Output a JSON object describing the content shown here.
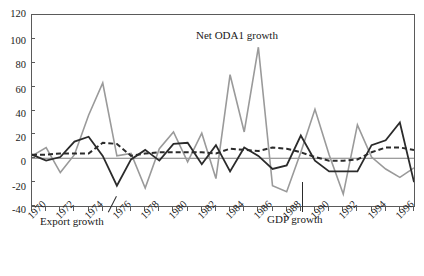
{
  "chart_data": {
    "type": "line",
    "title": "",
    "xlabel": "",
    "ylabel": "",
    "ylim": [
      -40,
      120
    ],
    "xlim": [
      1970,
      1997
    ],
    "yticks": [
      -40,
      -20,
      0,
      20,
      40,
      60,
      80,
      100,
      120
    ],
    "xticks": [
      1970,
      1972,
      1974,
      1976,
      1978,
      1980,
      1982,
      1984,
      1986,
      1988,
      1990,
      1992,
      1994,
      1996
    ],
    "xtick_labels": [
      "1970",
      "1972",
      "1974",
      "1976",
      "1978",
      "1980",
      "1982",
      "1984",
      "1986",
      "1988",
      "1990",
      "1992",
      "1994",
      "1996"
    ],
    "grid": false,
    "legend": "annotations-inline",
    "x": [
      1970,
      1971,
      1972,
      1973,
      1974,
      1975,
      1976,
      1977,
      1978,
      1979,
      1980,
      1981,
      1982,
      1983,
      1984,
      1985,
      1986,
      1987,
      1988,
      1989,
      1990,
      1991,
      1992,
      1993,
      1994,
      1995,
      1996,
      1997
    ],
    "series": [
      {
        "name": "Net ODA1 growth",
        "color": "#9a9a9a",
        "style": "solid",
        "width": 1.6,
        "values": [
          2,
          9,
          -12,
          3,
          36,
          63,
          2,
          4,
          -25,
          8,
          22,
          -3,
          21,
          -17,
          70,
          22,
          93,
          -23,
          -28,
          5,
          41,
          3,
          -30,
          28,
          1,
          -9,
          -16,
          -8
        ]
      },
      {
        "name": "Export growth",
        "color": "#2b2b2b",
        "style": "solid",
        "width": 1.8,
        "values": [
          3,
          -2,
          1,
          14,
          18,
          2,
          -23,
          -1,
          7,
          -2,
          12,
          13,
          -5,
          11,
          -11,
          9,
          2,
          -9,
          -6,
          19,
          -2,
          -11,
          -11,
          -11,
          11,
          15,
          30,
          -20
        ]
      },
      {
        "name": "GDP growth",
        "color": "#2b2b2b",
        "style": "dashed",
        "width": 2.0,
        "values": [
          3,
          3,
          4,
          4,
          4,
          13,
          12,
          2,
          4,
          5,
          5,
          5,
          5,
          4,
          8,
          7,
          6,
          9,
          8,
          5,
          1,
          -2,
          -2,
          -1,
          5,
          9,
          9,
          7
        ]
      }
    ],
    "annotations": [
      {
        "label": "Net ODA1 growth",
        "x": 1983.0,
        "y": 106
      },
      {
        "label": "Export growth",
        "x": 1971.0,
        "y": -34
      },
      {
        "label": "GDP growth",
        "x": 1989.6,
        "y": -32
      }
    ],
    "zero_line": 0
  }
}
